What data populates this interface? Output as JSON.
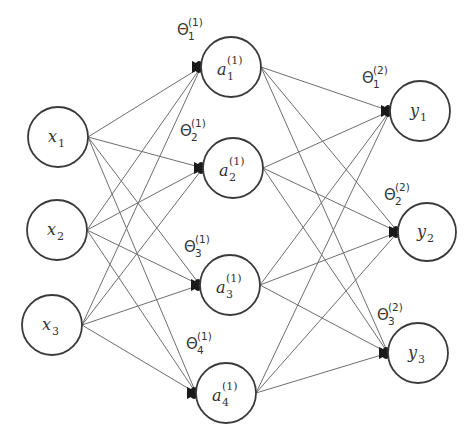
{
  "diagram": {
    "title": "",
    "type": "feedforward neural network",
    "colors": {
      "background": "#ffffff",
      "node_stroke": "#3a3a3a",
      "edge": "#6e6e6e",
      "arrowhead": "#1a1a1a",
      "text": "#333333"
    },
    "layers": [
      {
        "name": "input",
        "nodes": [
          {
            "id": "x1",
            "symbol": "x",
            "sub": "1",
            "sup": "",
            "cx": 58,
            "cy": 137,
            "r": 30
          },
          {
            "id": "x2",
            "symbol": "x",
            "sub": "2",
            "sup": "",
            "cx": 57,
            "cy": 230,
            "r": 30
          },
          {
            "id": "x3",
            "symbol": "x",
            "sub": "3",
            "sup": "",
            "cx": 52,
            "cy": 325,
            "r": 30
          }
        ]
      },
      {
        "name": "hidden",
        "nodes": [
          {
            "id": "a1",
            "symbol": "a",
            "sub": "1",
            "sup": "(1)",
            "cx": 231,
            "cy": 67,
            "r": 30
          },
          {
            "id": "a2",
            "symbol": "a",
            "sub": "2",
            "sup": "(1)",
            "cx": 233,
            "cy": 168,
            "r": 30
          },
          {
            "id": "a3",
            "symbol": "a",
            "sub": "3",
            "sup": "(1)",
            "cx": 230,
            "cy": 285,
            "r": 30
          },
          {
            "id": "a4",
            "symbol": "a",
            "sub": "4",
            "sup": "(1)",
            "cx": 226,
            "cy": 393,
            "r": 30
          }
        ]
      },
      {
        "name": "output",
        "nodes": [
          {
            "id": "y1",
            "symbol": "y",
            "sub": "1",
            "sup": "",
            "cx": 420,
            "cy": 111,
            "r": 30
          },
          {
            "id": "y2",
            "symbol": "y",
            "sub": "2",
            "sup": "",
            "cx": 427,
            "cy": 232,
            "r": 29
          },
          {
            "id": "y3",
            "symbol": "y",
            "sub": "3",
            "sup": "",
            "cx": 418,
            "cy": 353,
            "r": 30
          }
        ]
      }
    ],
    "weights": [
      {
        "id": "theta1_1",
        "symbol": "Θ",
        "sub": "1",
        "sup": "(1)",
        "x": 177,
        "y": 35
      },
      {
        "id": "theta2_1",
        "symbol": "Θ",
        "sub": "2",
        "sup": "(1)",
        "x": 180,
        "y": 136
      },
      {
        "id": "theta3_1",
        "symbol": "Θ",
        "sub": "3",
        "sup": "(1)",
        "x": 184,
        "y": 252
      },
      {
        "id": "theta4_1",
        "symbol": "Θ",
        "sub": "4",
        "sup": "(1)",
        "x": 186,
        "y": 349
      },
      {
        "id": "theta1_2",
        "symbol": "Θ",
        "sub": "1",
        "sup": "(2)",
        "x": 362,
        "y": 83
      },
      {
        "id": "theta2_2",
        "symbol": "Θ",
        "sub": "2",
        "sup": "(2)",
        "x": 384,
        "y": 200
      },
      {
        "id": "theta3_2",
        "symbol": "Θ",
        "sub": "3",
        "sup": "(2)",
        "x": 377,
        "y": 320
      }
    ],
    "connections": "fully-connected input→hidden and hidden→output; arrowheads at destination node left edge"
  }
}
